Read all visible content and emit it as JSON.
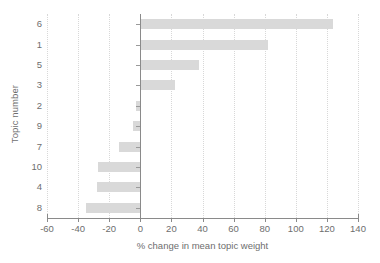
{
  "chart_data": {
    "type": "bar",
    "orientation": "horizontal",
    "title": "",
    "xlabel": "% change in mean topic weight",
    "ylabel": "Topic number",
    "categories": [
      "6",
      "1",
      "5",
      "3",
      "2",
      "9",
      "7",
      "10",
      "4",
      "8"
    ],
    "values": [
      124,
      82,
      38,
      22,
      -2.5,
      -5,
      -13.5,
      -27,
      -28,
      -35
    ],
    "xlim": [
      -60,
      140
    ],
    "xticks": [
      -60,
      -40,
      -20,
      0,
      20,
      40,
      60,
      80,
      100,
      120,
      140
    ],
    "xticklabels": [
      "-60",
      "-40",
      "-20",
      "0",
      "20",
      "40",
      "60",
      "80",
      "100",
      "120",
      "140"
    ],
    "grid": "vertical-dotted",
    "legend": null,
    "bar_color": "#d9d9d9",
    "axis_color": "#8a8a8a",
    "grid_color": "#d8d8d8",
    "text_color": "#6e6e6e"
  }
}
